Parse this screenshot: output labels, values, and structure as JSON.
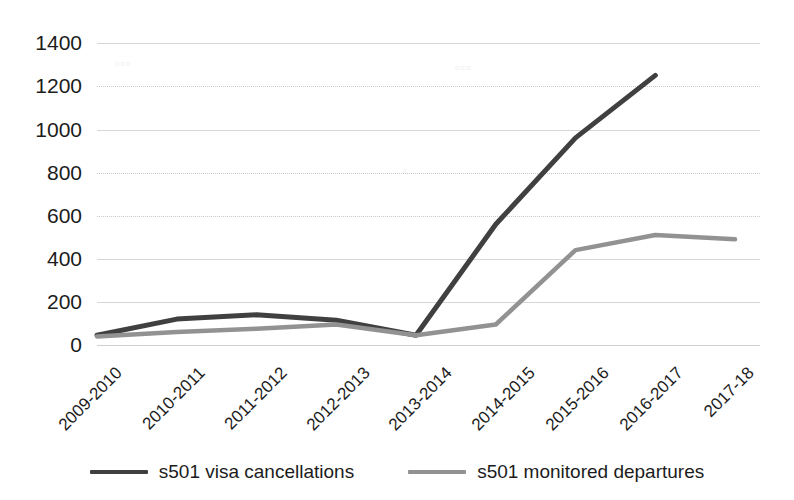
{
  "chart_data": {
    "type": "line",
    "title": "",
    "xlabel": "",
    "ylabel": "",
    "categories": [
      "2009-2010",
      "2010-2011",
      "2011-2012",
      "2012-2013",
      "2013-2014",
      "2014-2015",
      "2015-2016",
      "2016-2017",
      "2017-18"
    ],
    "series": [
      {
        "name": "s501 visa cancellations",
        "color": "#404040",
        "values": [
          45,
          120,
          140,
          115,
          45,
          560,
          960,
          1250,
          null
        ]
      },
      {
        "name": "s501 monitored departures",
        "color": "#929292",
        "values": [
          40,
          60,
          75,
          95,
          45,
          95,
          440,
          510,
          490
        ]
      }
    ],
    "yticks": [
      0,
      200,
      400,
      600,
      800,
      1000,
      1200,
      1400
    ],
    "ylim": [
      0,
      1400
    ],
    "grid": true,
    "legend_position": "bottom"
  },
  "axis": {
    "y_tick_labels": [
      "1400",
      "1200",
      "1000",
      "800",
      "600",
      "400",
      "200",
      "0"
    ],
    "x_tick_labels": [
      "2009-2010",
      "2010-2011",
      "2011-2012",
      "2012-2013",
      "2013-2014",
      "2014-2015",
      "2015-2016",
      "2016-2017",
      "2017-18"
    ]
  },
  "legend": {
    "items": [
      {
        "label": "s501 visa cancellations",
        "color": "#404040"
      },
      {
        "label": "s501 monitored departures",
        "color": "#929292"
      }
    ]
  },
  "colors": {
    "series_dark": "#404040",
    "series_light": "#929292",
    "gridline": "#d6d6d6",
    "text": "#1c1c1c",
    "background": "#ffffff"
  }
}
